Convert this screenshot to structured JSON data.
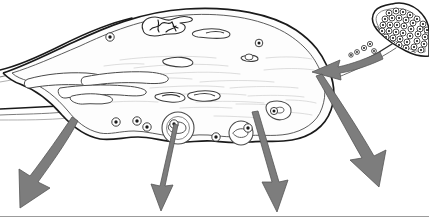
{
  "figure": {
    "title": "Neuron cell body with synaptic input and signal output arrows",
    "caption": "",
    "width": 429,
    "height": 220,
    "background_color": "#ffffff"
  },
  "style": {
    "outline_color": "#1a1a1a",
    "inner_line_color": "#4a4a4a",
    "faint_line_color": "#b9b9b9",
    "cytoplasm_fill": "#fdfdfd",
    "arrow_fill": "#7d7d7d",
    "arrow_stroke": "#555555",
    "vesicle_fill": "#ffffff",
    "vesicle_core": "#1a1a1a",
    "baseline_color": "#9b9b9b"
  },
  "parts": [
    {
      "id": "soma",
      "label": "Cell body (soma)",
      "role": "outline"
    },
    {
      "id": "plasma-membrane",
      "label": "Plasma membrane",
      "role": "outline"
    },
    {
      "id": "dendrite-left-upper",
      "label": "Dendrite (upper left process)",
      "role": "process"
    },
    {
      "id": "dendrite-left-lower",
      "label": "Dendrite (lower left process)",
      "role": "process"
    },
    {
      "id": "nucleus",
      "label": "Nucleus",
      "role": "organelle"
    },
    {
      "id": "nucleolus",
      "label": "Nucleolus",
      "role": "organelle"
    },
    {
      "id": "endoplasmic-reticulum",
      "label": "Rough endoplasmic reticulum",
      "role": "organelle"
    },
    {
      "id": "golgi-apparatus",
      "label": "Golgi apparatus",
      "role": "organelle"
    },
    {
      "id": "mitochondrion",
      "label": "Mitochondrion",
      "role": "organelle"
    },
    {
      "id": "lysosome",
      "label": "Lysosome / large vesicle",
      "role": "organelle"
    },
    {
      "id": "synaptic-terminal",
      "label": "Presynaptic terminal (bouton)",
      "role": "synapse"
    },
    {
      "id": "synaptic-vesicles",
      "label": "Synaptic vesicles",
      "role": "synapse"
    },
    {
      "id": "axon",
      "label": "Incoming axon",
      "role": "process"
    }
  ],
  "arrows": [
    {
      "id": "input-arrow",
      "label": "Synaptic input",
      "direction": "inward",
      "shape": "curved"
    },
    {
      "id": "output-arrow-1",
      "label": "Output 1",
      "direction": "outward",
      "shape": "curved"
    },
    {
      "id": "output-arrow-2",
      "label": "Output 2",
      "direction": "outward",
      "shape": "straight"
    },
    {
      "id": "output-arrow-3",
      "label": "Output 3",
      "direction": "outward",
      "shape": "straight"
    },
    {
      "id": "output-arrow-4",
      "label": "Output 4",
      "direction": "outward",
      "shape": "curved"
    }
  ]
}
